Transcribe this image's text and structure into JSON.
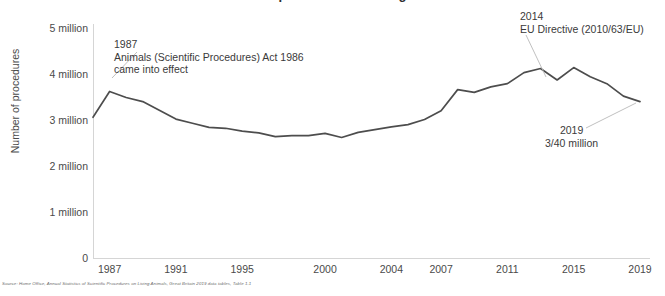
{
  "chart_data": {
    "type": "line",
    "title": "",
    "xlabel": "",
    "ylabel": "Number of procedures",
    "ylim": [
      0,
      5000000
    ],
    "xlim": [
      1986,
      2019
    ],
    "grid": false,
    "legend_position": "none",
    "line_color": "#4d4d4d",
    "y_tick_labels": [
      "5 million",
      "4 million",
      "3 million",
      "2 million",
      "1 million",
      "0"
    ],
    "y_tick_values": [
      5000000,
      4000000,
      3000000,
      2000000,
      1000000,
      0
    ],
    "x_tick_labels": [
      "1987",
      "1991",
      "1995",
      "2000",
      "2004",
      "2007",
      "2011",
      "2015",
      "2019"
    ],
    "x_tick_values": [
      1987,
      1991,
      1995,
      2000,
      2004,
      2007,
      2011,
      2015,
      2019
    ],
    "x": [
      1986,
      1987,
      1988,
      1989,
      1990,
      1991,
      1992,
      1993,
      1994,
      1995,
      1996,
      1997,
      1998,
      1999,
      2000,
      2001,
      2002,
      2003,
      2004,
      2005,
      2006,
      2007,
      2008,
      2009,
      2010,
      2011,
      2012,
      2013,
      2014,
      2015,
      2016,
      2017,
      2018,
      2019
    ],
    "values": [
      3060000,
      3620000,
      3490000,
      3400000,
      3210000,
      3020000,
      2930000,
      2840000,
      2820000,
      2760000,
      2720000,
      2640000,
      2660000,
      2660000,
      2710000,
      2620000,
      2730000,
      2790000,
      2850000,
      2900000,
      3010000,
      3200000,
      3660000,
      3600000,
      3720000,
      3790000,
      4030000,
      4120000,
      3870000,
      4140000,
      3940000,
      3790000,
      3520000,
      3400000
    ],
    "annotations": [
      {
        "id": "1987",
        "year_label": "1987",
        "lines": [
          "1987",
          "Animals (Scientific Procedures) Act 1986",
          "came into effect"
        ],
        "points_to_year": 1987
      },
      {
        "id": "2014",
        "year_label": "2014",
        "lines": [
          "2014",
          "EU Directive (2010/63/EU)"
        ],
        "points_to_year": 2014
      },
      {
        "id": "2019",
        "year_label": "2019",
        "lines": [
          "2019",
          "3/40 million"
        ],
        "points_to_year": 2019
      }
    ]
  },
  "source": {
    "text": "Source: Home Office, Annual Statistics of Scientific Procedures on Living Animals, Great Britain 2019 data tables, Table 1.1"
  },
  "header": {
    "title_clipped": "Number of scientific procedures on living animals"
  }
}
